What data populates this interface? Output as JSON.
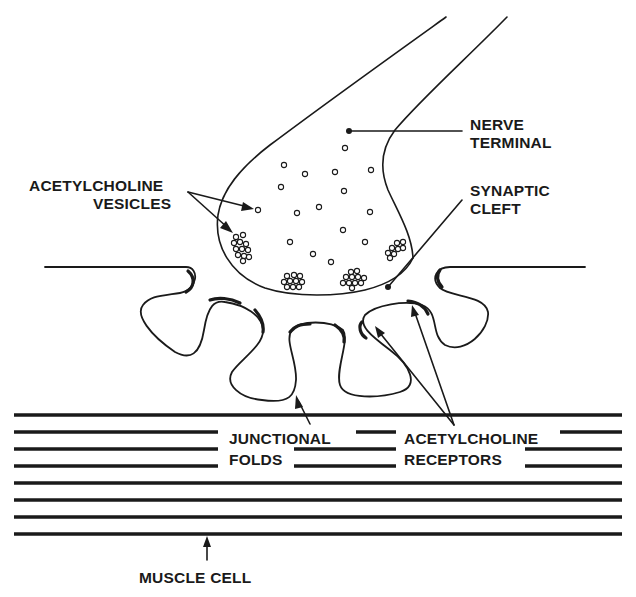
{
  "diagram": {
    "colors": {
      "ink": "#1a1a1a",
      "background": "#ffffff"
    },
    "labels": {
      "acetylcholine_vesicles": {
        "line1": "ACETYLCHOLINE",
        "line2": "VESICLES"
      },
      "nerve_terminal": {
        "line1": "NERVE",
        "line2": "TERMINAL"
      },
      "synaptic_cleft": {
        "line1": "SYNAPTIC",
        "line2": "CLEFT"
      },
      "junctional_folds": {
        "line1": "JUNCTIONAL",
        "line2": "FOLDS"
      },
      "acetylcholine_receptors": {
        "line1": "ACETYLCHOLINE",
        "line2": "RECEPTORS"
      },
      "muscle_cell": {
        "line1": "MUSCLE CELL"
      }
    },
    "structures": [
      "nerve-terminal",
      "acetylcholine-vesicles",
      "synaptic-cleft",
      "junctional-folds",
      "acetylcholine-receptors",
      "muscle-cell"
    ]
  }
}
